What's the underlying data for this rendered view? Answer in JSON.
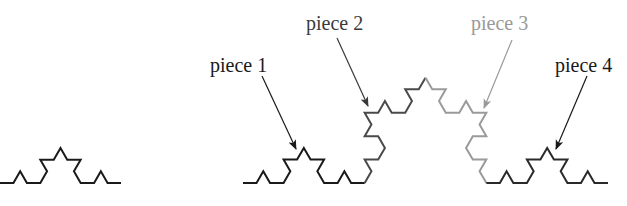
{
  "figure": {
    "width": 627,
    "height": 206,
    "background": "#ffffff"
  },
  "small_curve": {
    "name": "koch-curve-level-2",
    "level": 2,
    "start": [
      0,
      183
    ],
    "end": [
      121,
      183
    ],
    "color": "#1a1a1a",
    "stroke_width": 2
  },
  "big_curve": {
    "name": "koch-curve-level-3",
    "level": 3,
    "start": [
      243,
      183
    ],
    "end": [
      608,
      183
    ],
    "stroke_width": 2,
    "piece_colors": [
      "#1a1a1a",
      "#4a4a4a",
      "#9a9a9a",
      "#2a2a2a"
    ]
  },
  "pieces": [
    {
      "label": "piece 1",
      "color": "#1a1a1a",
      "text_x": 210,
      "text_y": 72,
      "arrow_from": [
        262,
        76
      ],
      "arrow_to": [
        296,
        149
      ]
    },
    {
      "label": "piece 2",
      "color": "#3a3a3a",
      "text_x": 306,
      "text_y": 30,
      "arrow_from": [
        337,
        38
      ],
      "arrow_to": [
        368,
        106
      ]
    },
    {
      "label": "piece 3",
      "color": "#999999",
      "text_x": 471,
      "text_y": 30,
      "arrow_from": [
        512,
        40
      ],
      "arrow_to": [
        484,
        108
      ]
    },
    {
      "label": "piece 4",
      "color": "#1a1a1a",
      "text_x": 555,
      "text_y": 72,
      "arrow_from": [
        587,
        76
      ],
      "arrow_to": [
        556,
        149
      ]
    }
  ]
}
